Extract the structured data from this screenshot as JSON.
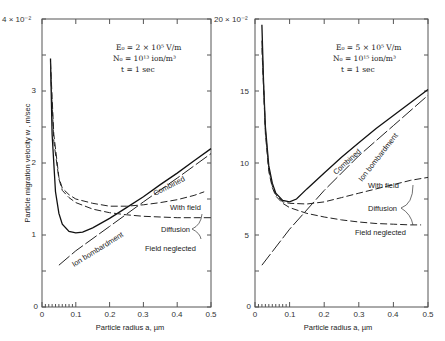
{
  "chart_data": [
    {
      "type": "line",
      "title": "",
      "annotation": [
        "E0 = 2 × 10^5 V/m",
        "N0 = 10^13 ion/m^3",
        "t = 1 sec"
      ],
      "xlabel": "Particle radius a, µm",
      "ylabel": "Particle migration velocity w, m/sec",
      "y_multiplier": "× 10^-2",
      "xlim": [
        0,
        0.5
      ],
      "ylim": [
        0,
        4
      ],
      "xticks": [
        0,
        0.1,
        0.2,
        0.3,
        0.4,
        0.5
      ],
      "yticks": [
        0,
        1,
        2,
        3,
        4
      ],
      "grid": false,
      "series": [
        {
          "name": "Combined",
          "style": "solid",
          "x": [
            0.025,
            0.03,
            0.04,
            0.05,
            0.06,
            0.08,
            0.1,
            0.12,
            0.15,
            0.2,
            0.25,
            0.3,
            0.35,
            0.4,
            0.45,
            0.5
          ],
          "y": [
            3.45,
            2.4,
            1.6,
            1.3,
            1.15,
            1.05,
            1.03,
            1.04,
            1.1,
            1.23,
            1.38,
            1.53,
            1.7,
            1.86,
            2.03,
            2.2
          ]
        },
        {
          "name": "Ion bombardment",
          "style": "long-dash",
          "x": [
            0.05,
            0.1,
            0.2,
            0.3,
            0.4,
            0.5
          ],
          "y": [
            0.58,
            0.78,
            1.12,
            1.46,
            1.79,
            2.13
          ]
        },
        {
          "name": "Diffusion - With field",
          "style": "dashed",
          "x": [
            0.025,
            0.035,
            0.05,
            0.06,
            0.08,
            0.1,
            0.15,
            0.2,
            0.25,
            0.3,
            0.35,
            0.4,
            0.45,
            0.48
          ],
          "y": [
            3.4,
            2.4,
            1.8,
            1.65,
            1.56,
            1.5,
            1.44,
            1.4,
            1.4,
            1.42,
            1.45,
            1.49,
            1.55,
            1.6
          ]
        },
        {
          "name": "Diffusion - Field neglected",
          "style": "dashed",
          "x": [
            0.025,
            0.035,
            0.05,
            0.06,
            0.08,
            0.1,
            0.15,
            0.2,
            0.25,
            0.3,
            0.35,
            0.4,
            0.45,
            0.5
          ],
          "y": [
            3.3,
            2.3,
            1.78,
            1.62,
            1.52,
            1.45,
            1.36,
            1.31,
            1.28,
            1.26,
            1.25,
            1.24,
            1.24,
            1.24
          ]
        }
      ],
      "labels": {
        "combined": "Combined",
        "ion": "Ion bombardment",
        "with_field": "With field",
        "diffusion": "Diffusion",
        "field_neglected": "Field neglected"
      }
    },
    {
      "type": "line",
      "title": "",
      "annotation": [
        "E0 = 5 × 10^5 V/m",
        "N0 = 10^15 ion/m^3",
        "t = 1 sec"
      ],
      "xlabel": "Particle radius a, µm",
      "ylabel": "",
      "y_multiplier": "× 10^-2",
      "xlim": [
        0,
        0.5
      ],
      "ylim": [
        0,
        20
      ],
      "xticks": [
        0,
        0.1,
        0.2,
        0.3,
        0.4,
        0.5
      ],
      "yticks": [
        0,
        5,
        10,
        15,
        20
      ],
      "grid": false,
      "series": [
        {
          "name": "Combined",
          "style": "solid",
          "x": [
            0.02,
            0.025,
            0.03,
            0.04,
            0.05,
            0.06,
            0.08,
            0.1,
            0.12,
            0.15,
            0.2,
            0.25,
            0.3,
            0.35,
            0.4,
            0.45,
            0.5
          ],
          "y": [
            19.6,
            15.5,
            12.5,
            9.8,
            8.6,
            7.9,
            7.4,
            7.3,
            7.5,
            8.2,
            9.3,
            10.4,
            11.4,
            12.4,
            13.3,
            14.2,
            15.1
          ]
        },
        {
          "name": "Ion bombardment",
          "style": "long-dash",
          "x": [
            0.02,
            0.1,
            0.2,
            0.3,
            0.4,
            0.5
          ],
          "y": [
            2.9,
            5.4,
            8.1,
            10.5,
            12.6,
            14.7
          ]
        },
        {
          "name": "Diffusion - With field",
          "style": "dashed",
          "x": [
            0.02,
            0.03,
            0.04,
            0.05,
            0.06,
            0.08,
            0.1,
            0.15,
            0.2,
            0.25,
            0.3,
            0.35,
            0.4,
            0.45,
            0.5
          ],
          "y": [
            18.5,
            12.3,
            9.6,
            8.4,
            7.8,
            7.3,
            7.2,
            7.15,
            7.3,
            7.6,
            7.9,
            8.2,
            8.5,
            8.8,
            9.0
          ]
        },
        {
          "name": "Diffusion - Field neglected",
          "style": "dashed",
          "x": [
            0.02,
            0.03,
            0.04,
            0.05,
            0.06,
            0.08,
            0.1,
            0.15,
            0.2,
            0.25,
            0.3,
            0.35,
            0.4,
            0.45,
            0.48
          ],
          "y": [
            18.0,
            12.0,
            9.4,
            8.3,
            7.7,
            7.2,
            6.9,
            6.5,
            6.25,
            6.05,
            5.9,
            5.8,
            5.75,
            5.7,
            5.7
          ]
        }
      ],
      "labels": {
        "combined": "Combined",
        "ion": "Ion bombardment",
        "with_field": "With field",
        "diffusion": "Diffusion",
        "field_neglected": "Field neglected"
      }
    }
  ],
  "left": {
    "ytop_label": "4 × 10⁻²",
    "ylabel": "Particle migration velocity  w , m/sec",
    "xlabel": "Particle radius a, µm",
    "ann": [
      "E₀ = 2 × 10⁵ V/m",
      "N₀ = 10¹³ ion/m³",
      "t = 1 sec"
    ],
    "yticks": [
      "0",
      "1",
      "2",
      "3"
    ],
    "xticks": [
      "0",
      "0.1",
      "0.2",
      "0.3",
      "0.4",
      "0.5"
    ],
    "labels": {
      "combined": "Combined",
      "ion": "Ion bombardment",
      "with_field": "With field",
      "diffusion": "Diffusion",
      "field_neglected": "Field neglected"
    }
  },
  "right": {
    "ytop_label": "20 × 10⁻²",
    "xlabel": "Particle radius a, µm",
    "ann": [
      "E₀ = 5 × 10⁵ V/m",
      "N₀ = 10¹⁵ ion/m³",
      "t = 1 sec"
    ],
    "yticks": [
      "0",
      "5",
      "10",
      "15"
    ],
    "xticks": [
      "0",
      "0.1",
      "0.2",
      "0.3",
      "0.4",
      "0.5"
    ],
    "labels": {
      "combined": "Combined",
      "ion": "Ion bombardment",
      "with_field": "With field",
      "diffusion": "Diffusion",
      "field_neglected": "Field neglected"
    }
  }
}
